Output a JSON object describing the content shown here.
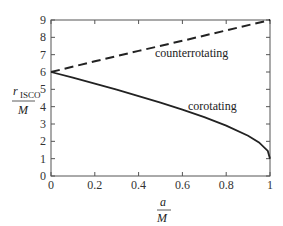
{
  "chart_data": {
    "type": "line",
    "title": "",
    "xlabel": "a/M",
    "ylabel": "r_ISCO/M",
    "xlim": [
      0,
      1
    ],
    "ylim": [
      0,
      9
    ],
    "x_ticks": [
      "0",
      "0.2",
      "0.4",
      "0.6",
      "0.8",
      "1"
    ],
    "y_ticks": [
      "0",
      "1",
      "2",
      "3",
      "4",
      "5",
      "6",
      "7",
      "8",
      "9"
    ],
    "grid": false,
    "series": [
      {
        "name": "counterrotating",
        "style": "dashed",
        "x": [
          0,
          0.2,
          0.4,
          0.6,
          0.8,
          1.0
        ],
        "values": [
          6.0,
          6.62,
          7.22,
          7.8,
          8.4,
          9.0
        ]
      },
      {
        "name": "corotating",
        "style": "solid",
        "x": [
          0,
          0.1,
          0.2,
          0.3,
          0.4,
          0.5,
          0.6,
          0.7,
          0.8,
          0.9,
          0.95,
          0.99,
          1.0
        ],
        "values": [
          6.0,
          5.67,
          5.33,
          4.98,
          4.61,
          4.23,
          3.83,
          3.39,
          2.91,
          2.32,
          1.94,
          1.45,
          1.0
        ]
      }
    ],
    "annotations": [
      "counterrotating",
      "corotating"
    ]
  },
  "labels": {
    "y_num": "r",
    "y_sub": "ISCO",
    "y_den": "M",
    "x_num": "a",
    "x_den": "M",
    "counter": "counterrotating",
    "co": "corotating"
  }
}
